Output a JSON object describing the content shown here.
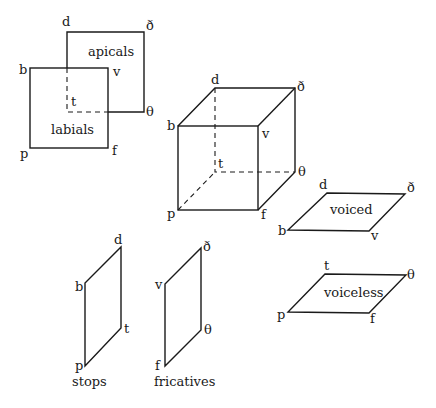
{
  "figures": {
    "overlap": {
      "apicals_label": "apicals",
      "labials_label": "labials",
      "corners": {
        "d": "d",
        "delta": "ð",
        "b": "b",
        "v": "v",
        "t": "t",
        "theta": "θ",
        "p": "p",
        "f": "f"
      }
    },
    "cube": {
      "corners": {
        "d": "d",
        "delta": "ð",
        "b": "b",
        "v": "v",
        "t": "t",
        "theta": "θ",
        "p": "p",
        "f": "f"
      }
    },
    "voiced": {
      "label": "voiced",
      "corners": {
        "d": "d",
        "delta": "ð",
        "b": "b",
        "v": "v"
      }
    },
    "voiceless": {
      "label": "voiceless",
      "corners": {
        "t": "t",
        "theta": "θ",
        "p": "p",
        "f": "f"
      }
    },
    "stops": {
      "label": "stops",
      "corners": {
        "d": "d",
        "b": "b",
        "t": "t",
        "p": "p"
      }
    },
    "fricatives": {
      "label": "fricatives",
      "corners": {
        "delta": "ð",
        "v": "v",
        "theta": "θ",
        "f": "f"
      }
    }
  }
}
